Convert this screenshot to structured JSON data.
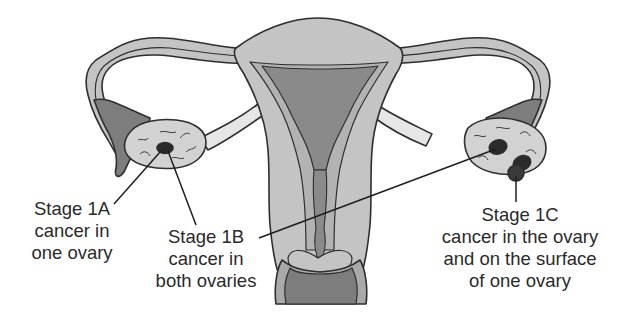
{
  "diagram": {
    "colors": {
      "background": "#ffffff",
      "outline": "#2e2e2e",
      "tissue_light": "#c4c4c4",
      "tissue_mid": "#a9a9a9",
      "tissue_dark": "#7d7d7d",
      "ovary": "#d2d2d2",
      "ligament": "#e6e6e6",
      "tumor": "#2b2b2b",
      "text": "#2a2a2a"
    },
    "structures": [
      "uterus",
      "left fallopian tube",
      "right fallopian tube",
      "left ovary",
      "right ovary",
      "cervix",
      "vagina"
    ],
    "labels": {
      "stage_1a": {
        "lines": [
          "Stage 1A",
          "cancer in",
          "one ovary"
        ]
      },
      "stage_1b": {
        "lines": [
          "Stage 1B",
          "cancer in",
          "both ovaries"
        ]
      },
      "stage_1c": {
        "lines": [
          "Stage 1C",
          "cancer in the ovary",
          "and on the surface",
          "of one ovary"
        ]
      }
    }
  }
}
